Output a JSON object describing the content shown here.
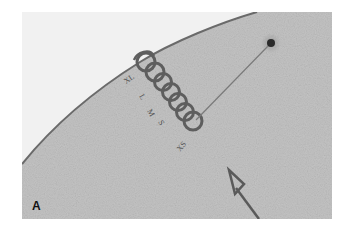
{
  "figure": {
    "panel_label": "A",
    "sizer_labels": [
      "XL",
      "L",
      "M",
      "S",
      "XS"
    ],
    "colors": {
      "background": "#ffffff",
      "tissue": "#c4c4c4",
      "outside": "#f1f1f1",
      "edge": "#6a6a6a",
      "template": "#5e5e5e",
      "arrow": "#5a5a5a"
    }
  }
}
